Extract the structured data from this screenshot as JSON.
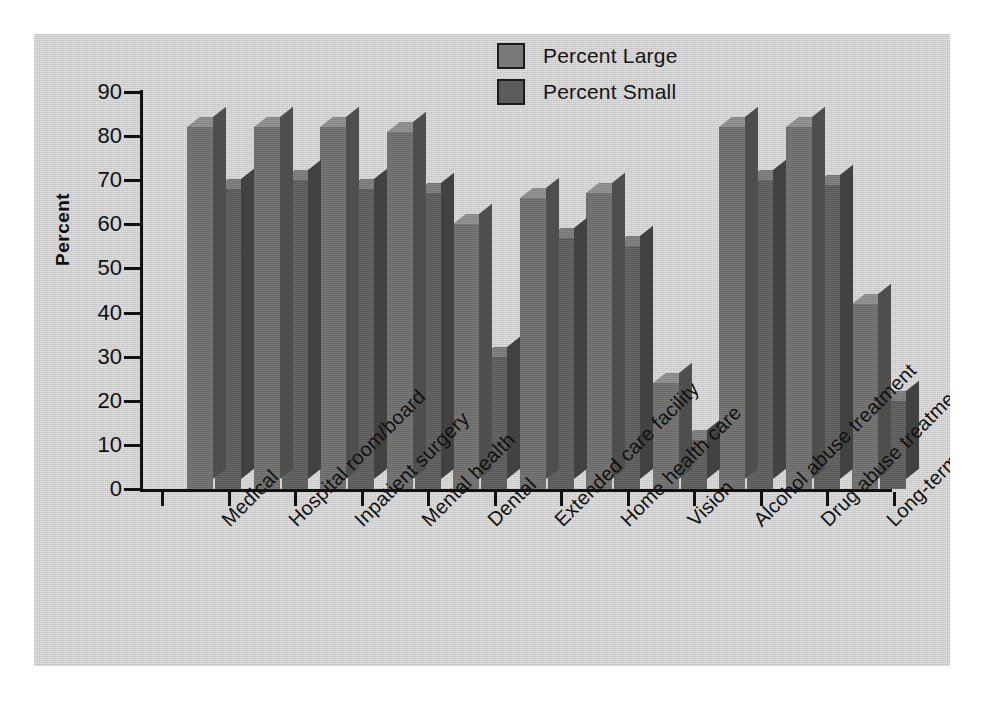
{
  "chart_data": {
    "type": "bar",
    "title": "",
    "xlabel": "",
    "ylabel": "Percent",
    "ylim": [
      0,
      90
    ],
    "ytick_values": [
      90,
      80,
      70,
      60,
      50,
      40,
      30,
      20,
      10,
      0
    ],
    "grid": false,
    "legend_position": "top-center",
    "orientation": "vertical-grouped-3d",
    "categories": [
      "Medical",
      "Hospital room/board",
      "Inpatient surgery",
      "Mental health",
      "Dental",
      "Extended care facility",
      "Home health care",
      "Vision",
      "Alcohol abuse treatment",
      "Drug abuse treatment",
      "Long-term disability"
    ],
    "series": [
      {
        "name": "Percent Large",
        "color": "#70706f",
        "values": [
          82,
          82,
          82,
          81,
          60,
          66,
          67,
          24,
          82,
          82,
          42
        ]
      },
      {
        "name": "Percent Small",
        "color": "#5e5e5d",
        "values": [
          68,
          70,
          68,
          67,
          30,
          57,
          55,
          11,
          70,
          69,
          20
        ]
      }
    ]
  },
  "legend": {
    "items": [
      {
        "label": "Percent Large",
        "swatch": "large"
      },
      {
        "label": "Percent Small",
        "swatch": "small"
      }
    ]
  },
  "axes": {
    "y_label": "Percent"
  }
}
